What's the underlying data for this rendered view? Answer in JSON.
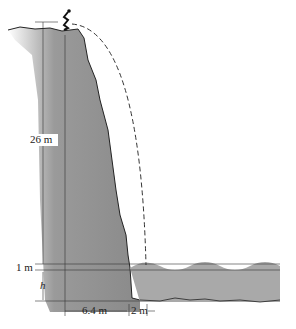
{
  "diagram": {
    "labels": {
      "cliff_height": "26 m",
      "water_above": "1 m",
      "depth": "h",
      "horizontal_base": "6.4 m",
      "horizontal_gap": "2 m"
    },
    "colors": {
      "rock": "#8c8c8c",
      "water": "#a9a9a9",
      "line": "#333333",
      "trajectory": "#333333"
    },
    "elements": [
      "cliff",
      "diver",
      "dashed-trajectory",
      "water-surface-waves",
      "dimension-lines"
    ]
  }
}
